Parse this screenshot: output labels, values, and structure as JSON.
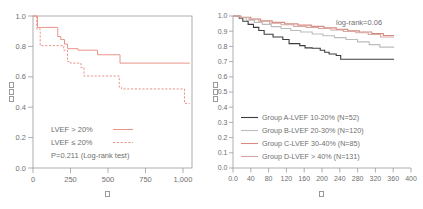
{
  "chart_data": [
    {
      "type": "line",
      "title": "",
      "subtitle": "",
      "xlabel": "日",
      "ylabel": "生存率",
      "xlabel_glyph": "tofu-box",
      "ylabel_glyph": "tofu-box",
      "xlim": [
        0,
        1060
      ],
      "ylim": [
        0.0,
        1.0
      ],
      "xticks": [
        0,
        250,
        500,
        750,
        1000
      ],
      "xticklabels": [
        "0",
        "250",
        "500",
        "750",
        "1,000"
      ],
      "yticks": [
        0.0,
        0.2,
        0.4,
        0.6,
        0.8,
        1.0
      ],
      "yticklabels": [
        "0.0",
        "0.2",
        "0.4",
        "0.6",
        "0.8",
        "1.0"
      ],
      "grid": false,
      "legend_position": "lower-left",
      "annotations": [
        "P=0.211  (Log-rank test)"
      ],
      "series": [
        {
          "name": "LVEF > 20%",
          "label": "LVEF > 20%",
          "color": "#e8948a",
          "style": "solid",
          "points": [
            [
              0,
              1.0
            ],
            [
              30,
              1.0
            ],
            [
              30,
              0.925
            ],
            [
              165,
              0.925
            ],
            [
              165,
              0.865
            ],
            [
              185,
              0.865
            ],
            [
              185,
              0.845
            ],
            [
              210,
              0.845
            ],
            [
              210,
              0.815
            ],
            [
              230,
              0.815
            ],
            [
              230,
              0.785
            ],
            [
              300,
              0.785
            ],
            [
              300,
              0.775
            ],
            [
              430,
              0.775
            ],
            [
              430,
              0.745
            ],
            [
              580,
              0.745
            ],
            [
              580,
              0.69
            ],
            [
              1045,
              0.69
            ]
          ]
        },
        {
          "name": "LVEF ≤ 20%",
          "label": "LVEF ≤ 20%",
          "color": "#e8948a",
          "style": "dashed",
          "points": [
            [
              0,
              1.0
            ],
            [
              25,
              1.0
            ],
            [
              25,
              0.915
            ],
            [
              48,
              0.915
            ],
            [
              48,
              0.805
            ],
            [
              205,
              0.805
            ],
            [
              205,
              0.775
            ],
            [
              230,
              0.775
            ],
            [
              230,
              0.7
            ],
            [
              250,
              0.7
            ],
            [
              250,
              0.69
            ],
            [
              320,
              0.69
            ],
            [
              320,
              0.66
            ],
            [
              340,
              0.66
            ],
            [
              340,
              0.605
            ],
            [
              575,
              0.605
            ],
            [
              575,
              0.53
            ],
            [
              590,
              0.53
            ],
            [
              590,
              0.52
            ],
            [
              1010,
              0.52
            ],
            [
              1010,
              0.425
            ],
            [
              1045,
              0.425
            ]
          ]
        }
      ]
    },
    {
      "type": "line",
      "title": "",
      "subtitle": "",
      "xlabel": "日",
      "ylabel": "生存率",
      "xlabel_glyph": "tofu-box",
      "ylabel_glyph": "tofu-box",
      "xlim": [
        0,
        400
      ],
      "ylim": [
        0.0,
        1.0
      ],
      "xticks": [
        0,
        40,
        80,
        120,
        160,
        200,
        240,
        280,
        320,
        360,
        400
      ],
      "xticklabels": [
        "0.0",
        "40",
        "80",
        "120",
        "160",
        "200",
        "240",
        "280",
        "320",
        "360",
        "400"
      ],
      "yticks": [
        0.0,
        0.1,
        0.2,
        0.3,
        0.4,
        0.5,
        0.6,
        0.7,
        0.8,
        0.9,
        1.0
      ],
      "yticklabels": [
        "0.0",
        "0.1",
        "0.2",
        "0.3",
        "0.4",
        "0.5",
        "0.6",
        "0.7",
        "0.8",
        "0.9",
        "1.0"
      ],
      "grid": false,
      "legend_position": "lower-left",
      "annotations": [
        "log-rank=0.06"
      ],
      "series": [
        {
          "name": "Group A-LVEF 10-20% (N=52)",
          "label": "Group A-LVEF 10-20%  (N=52)",
          "group": "A",
          "lvef_range": "10-20%",
          "n": 52,
          "color": "#3d3d3d",
          "style": "solid",
          "points": [
            [
              0,
              1.0
            ],
            [
              14,
              1.0
            ],
            [
              14,
              0.985
            ],
            [
              22,
              0.985
            ],
            [
              22,
              0.965
            ],
            [
              34,
              0.965
            ],
            [
              34,
              0.945
            ],
            [
              46,
              0.945
            ],
            [
              46,
              0.925
            ],
            [
              58,
              0.925
            ],
            [
              58,
              0.905
            ],
            [
              70,
              0.905
            ],
            [
              70,
              0.88
            ],
            [
              90,
              0.88
            ],
            [
              90,
              0.862
            ],
            [
              112,
              0.862
            ],
            [
              112,
              0.845
            ],
            [
              126,
              0.845
            ],
            [
              126,
              0.818
            ],
            [
              150,
              0.818
            ],
            [
              150,
              0.805
            ],
            [
              162,
              0.805
            ],
            [
              162,
              0.79
            ],
            [
              178,
              0.79
            ],
            [
              178,
              0.788
            ],
            [
              196,
              0.788
            ],
            [
              196,
              0.775
            ],
            [
              206,
              0.775
            ],
            [
              206,
              0.762
            ],
            [
              216,
              0.762
            ],
            [
              216,
              0.75
            ],
            [
              232,
              0.75
            ],
            [
              232,
              0.74
            ],
            [
              242,
              0.74
            ],
            [
              242,
              0.715
            ],
            [
              362,
              0.715
            ]
          ]
        },
        {
          "name": "Group B-LVEF 20-30% (N=120)",
          "label": "Group B-LVEF 20-30%  (N=120)",
          "group": "B",
          "lvef_range": "20-30%",
          "n": 120,
          "color": "#bcbcbc",
          "style": "solid",
          "points": [
            [
              0,
              1.0
            ],
            [
              16,
              1.0
            ],
            [
              16,
              0.988
            ],
            [
              30,
              0.988
            ],
            [
              30,
              0.972
            ],
            [
              48,
              0.972
            ],
            [
              48,
              0.958
            ],
            [
              66,
              0.958
            ],
            [
              66,
              0.945
            ],
            [
              86,
              0.945
            ],
            [
              86,
              0.93
            ],
            [
              108,
              0.93
            ],
            [
              108,
              0.918
            ],
            [
              130,
              0.918
            ],
            [
              130,
              0.905
            ],
            [
              152,
              0.905
            ],
            [
              152,
              0.895
            ],
            [
              178,
              0.895
            ],
            [
              178,
              0.882
            ],
            [
              202,
              0.882
            ],
            [
              202,
              0.87
            ],
            [
              228,
              0.87
            ],
            [
              228,
              0.858
            ],
            [
              254,
              0.858
            ],
            [
              254,
              0.845
            ],
            [
              280,
              0.845
            ],
            [
              280,
              0.83
            ],
            [
              306,
              0.83
            ],
            [
              306,
              0.812
            ],
            [
              330,
              0.812
            ],
            [
              330,
              0.795
            ],
            [
              362,
              0.795
            ]
          ]
        },
        {
          "name": "Group C-LVEF 30-40% (N=85)",
          "label": "Group C-LVEF 30-40%  (N=85)",
          "group": "C",
          "lvef_range": "30-40%",
          "n": 85,
          "color": "#d98a80",
          "style": "solid",
          "points": [
            [
              0,
              1.0
            ],
            [
              18,
              1.0
            ],
            [
              18,
              0.992
            ],
            [
              40,
              0.992
            ],
            [
              40,
              0.98
            ],
            [
              62,
              0.98
            ],
            [
              62,
              0.968
            ],
            [
              88,
              0.968
            ],
            [
              88,
              0.958
            ],
            [
              116,
              0.958
            ],
            [
              116,
              0.948
            ],
            [
              146,
              0.948
            ],
            [
              146,
              0.94
            ],
            [
              176,
              0.94
            ],
            [
              176,
              0.932
            ],
            [
              204,
              0.932
            ],
            [
              204,
              0.922
            ],
            [
              232,
              0.922
            ],
            [
              232,
              0.912
            ],
            [
              258,
              0.912
            ],
            [
              258,
              0.902
            ],
            [
              284,
              0.902
            ],
            [
              284,
              0.895
            ],
            [
              312,
              0.895
            ],
            [
              312,
              0.885
            ],
            [
              338,
              0.885
            ],
            [
              338,
              0.872
            ],
            [
              362,
              0.872
            ]
          ]
        },
        {
          "name": "Group D-LVEF > 40% (N=131)",
          "label": "Group D-LVEF > 40%  (N=131)",
          "group": "D",
          "lvef_range": "> 40%",
          "n": 131,
          "color": "#d4a9a4",
          "style": "solid",
          "points": [
            [
              0,
              1.0
            ],
            [
              16,
              1.0
            ],
            [
              16,
              0.99
            ],
            [
              36,
              0.99
            ],
            [
              36,
              0.978
            ],
            [
              58,
              0.978
            ],
            [
              58,
              0.965
            ],
            [
              82,
              0.965
            ],
            [
              82,
              0.952
            ],
            [
              108,
              0.952
            ],
            [
              108,
              0.942
            ],
            [
              136,
              0.942
            ],
            [
              136,
              0.932
            ],
            [
              164,
              0.932
            ],
            [
              164,
              0.925
            ],
            [
              192,
              0.925
            ],
            [
              192,
              0.918
            ],
            [
              220,
              0.918
            ],
            [
              220,
              0.908
            ],
            [
              248,
              0.908
            ],
            [
              248,
              0.898
            ],
            [
              276,
              0.898
            ],
            [
              276,
              0.89
            ],
            [
              304,
              0.89
            ],
            [
              304,
              0.878
            ],
            [
              332,
              0.878
            ],
            [
              332,
              0.862
            ],
            [
              362,
              0.862
            ]
          ]
        }
      ]
    }
  ],
  "colors": {
    "salmon": "#e8948a",
    "dark": "#3d3d3d",
    "light_gray": "#bcbcbc",
    "red": "#d98a80",
    "pink_gray": "#d4a9a4",
    "axis": "#8f8f8f",
    "text": "#6f6f6f",
    "background": "#ffffff"
  }
}
